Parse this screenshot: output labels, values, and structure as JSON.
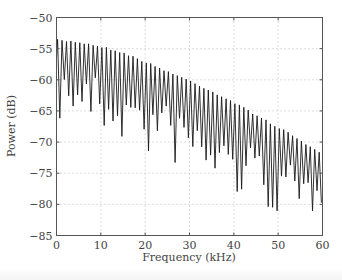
{
  "chart_data": {
    "type": "line",
    "title": "",
    "xlabel": "Frequency (kHz)",
    "ylabel": "Power (dB)",
    "xlim": [
      0,
      60
    ],
    "ylim": [
      -85,
      -50
    ],
    "xticks": [
      0,
      10,
      20,
      30,
      40,
      50,
      60
    ],
    "yticks": [
      -50,
      -55,
      -60,
      -65,
      -70,
      -75,
      -80,
      -85
    ],
    "grid": "dotted",
    "legend": null,
    "series": [
      {
        "name": "Power spectrum",
        "color": "#1a1a1a",
        "description": "Comb-like spectrum with ~1 kHz ripple period; peaks on a slowly decaying envelope, troughs deepen irregularly with frequency",
        "ripple_period_khz": 1.0,
        "upper_envelope": {
          "x": [
            0,
            5,
            10,
            15,
            20,
            25,
            30,
            35,
            40,
            45,
            50,
            55,
            60
          ],
          "y": [
            -53.5,
            -53.8,
            -54.5,
            -55.5,
            -57.0,
            -58.5,
            -60.0,
            -61.7,
            -63.5,
            -65.5,
            -67.5,
            -69.5,
            -72.0
          ]
        },
        "lower_envelope": {
          "x": [
            0,
            5,
            10,
            15,
            20,
            25,
            30,
            35,
            40,
            45,
            50,
            55,
            60
          ],
          "y": [
            -67.0,
            -66.0,
            -69.0,
            -70.0,
            -72.5,
            -73.5,
            -75.0,
            -77.0,
            -79.0,
            -80.0,
            -82.0,
            -84.0,
            -80.0
          ]
        }
      }
    ]
  }
}
